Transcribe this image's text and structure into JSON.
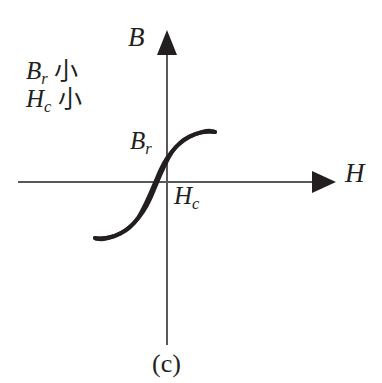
{
  "figure": {
    "caption": "(c)",
    "background_color": "#ffffff",
    "ink_color": "#231f20",
    "axis_color": "#58595b",
    "curve_color": "#231f20"
  },
  "axes": {
    "vertical": {
      "label": "B",
      "name": "magnetic-flux-density",
      "arrow": "arrow-up"
    },
    "horizontal": {
      "label": "H",
      "name": "magnetic-field-strength",
      "arrow": "arrow-right"
    }
  },
  "annotations": {
    "remanence": {
      "symbol": "B",
      "subscript": "r",
      "qualifier": "小"
    },
    "coercivity": {
      "symbol": "H",
      "subscript": "c",
      "qualifier": "小"
    }
  },
  "curve_labels": {
    "remanence": {
      "symbol": "B",
      "subscript": "r"
    },
    "coercivity": {
      "symbol": "H",
      "subscript": "c"
    }
  },
  "chart_data": {
    "type": "line",
    "title": "(c)",
    "xlabel": "H",
    "ylabel": "B",
    "grid": false,
    "legend": null,
    "axis_origin_px": [
      167,
      182
    ],
    "xlim_px": [
      18,
      330
    ],
    "ylim_px": [
      32,
      345
    ],
    "markers": {
      "remanence_px": [
        167,
        155
      ],
      "negative_remanence_px": [
        167,
        210
      ],
      "coercivity_px": [
        177,
        182
      ],
      "negative_coercivity_px": [
        157,
        182
      ],
      "saturation_positive_px": [
        215,
        132
      ],
      "saturation_negative_px": [
        95,
        238
      ]
    },
    "series": [
      {
        "name": "upper-branch",
        "path": "M 215 132 C 196 130 181 139 172 152 C 163 166 157 183 150 199 C 142 217 128 233 108 238 C 101 240 96 239 95 238"
      },
      {
        "name": "lower-branch",
        "path": "M 95 238 C 114 240 129 231 138 218 C 147 204 153 187 160 171 C 168 153 182 137 202 132 C 209 130 214 131 215 132"
      }
    ]
  }
}
